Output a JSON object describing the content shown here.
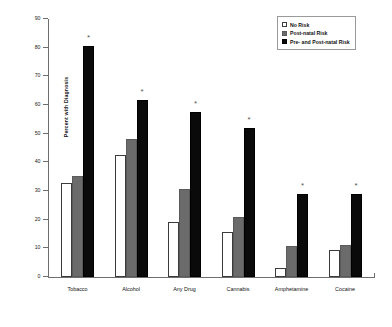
{
  "chart_data": {
    "type": "bar",
    "title": "",
    "xlabel": "",
    "ylabel": "Percent with Diagnosis",
    "ylim": [
      0,
      90
    ],
    "yticks": [
      0,
      10,
      20,
      30,
      40,
      50,
      60,
      70,
      80,
      90
    ],
    "grid": false,
    "legend_position": "top-right",
    "categories": [
      "Tobacco",
      "Alcohol",
      "Any Drug",
      "Cannabis",
      "Amphetamine",
      "Cocaine"
    ],
    "series": [
      {
        "name": "No Risk",
        "color": "#ffffff",
        "values": [
          32.7,
          42.4,
          19.3,
          15.6,
          3.1,
          9.5
        ]
      },
      {
        "name": "Post-natal Risk",
        "color": "#6b6b6b",
        "values": [
          35.1,
          48.0,
          30.6,
          20.9,
          10.8,
          11.1
        ]
      },
      {
        "name": "Pre- and Post-natal Risk",
        "color": "#0a0a0a",
        "values": [
          80.6,
          61.9,
          57.7,
          52.1,
          28.8,
          28.9
        ]
      }
    ],
    "annotations": [
      {
        "symbol": "*",
        "category": "Tobacco",
        "series": "Pre- and Post-natal Risk"
      },
      {
        "symbol": "*",
        "category": "Alcohol",
        "series": "Pre- and Post-natal Risk"
      },
      {
        "symbol": "*",
        "category": "Any Drug",
        "series": "Pre- and Post-natal Risk"
      },
      {
        "symbol": "*",
        "category": "Cannabis",
        "series": "Pre- and Post-natal Risk"
      },
      {
        "symbol": "*",
        "category": "Amphetamine",
        "series": "Pre- and Post-natal Risk"
      },
      {
        "symbol": "*",
        "category": "Cocaine",
        "series": "Pre- and Post-natal Risk"
      }
    ]
  },
  "legend": {
    "items": [
      {
        "label": "No Risk",
        "key": "norisk"
      },
      {
        "label": "Post-natal Risk",
        "key": "postnatal"
      },
      {
        "label": "Pre- and Post-natal Risk",
        "key": "prepost"
      }
    ]
  }
}
